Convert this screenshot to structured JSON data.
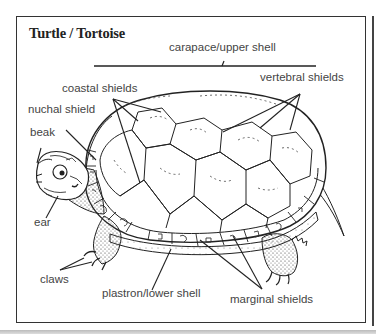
{
  "title": "Turtle / Tortoise",
  "labels": {
    "carapace": "carapace/upper shell",
    "coastal": "coastal shields",
    "vertebral": "vertebral shields",
    "nuchal": "nuchal shield",
    "beak": "beak",
    "ear": "ear",
    "claws": "claws",
    "plastron": "plastron/lower shell",
    "marginal": "marginal shields"
  },
  "illustration": {
    "subject": "turtle-side-view",
    "line_color": "#222222",
    "label_color": "#444444",
    "background": "#ffffff"
  }
}
